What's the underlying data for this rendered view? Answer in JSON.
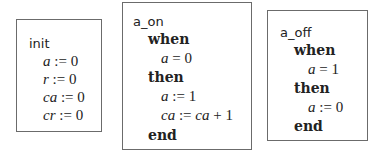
{
  "events": [
    {
      "name": "init",
      "actions": [
        {
          "var": "a",
          "op": ":=",
          "expr": "0"
        },
        {
          "var": "r",
          "op": ":=",
          "expr": "0"
        },
        {
          "var": "ca",
          "op": ":=",
          "expr": "0"
        },
        {
          "var": "cr",
          "op": ":=",
          "expr": "0"
        }
      ]
    },
    {
      "name": "a_on",
      "when_kw": "when",
      "guard": {
        "var": "a",
        "op": "=",
        "expr": "0"
      },
      "then_kw": "then",
      "actions": [
        {
          "var": "a",
          "op": ":=",
          "expr": "1"
        },
        {
          "var": "ca",
          "op": ":=",
          "expr_var": "ca",
          "expr_rest": "+ 1"
        }
      ],
      "end_kw": "end"
    },
    {
      "name": "a_off",
      "when_kw": "when",
      "guard": {
        "var": "a",
        "op": "=",
        "expr": "1"
      },
      "then_kw": "then",
      "actions": [
        {
          "var": "a",
          "op": ":=",
          "expr": "0"
        }
      ],
      "end_kw": "end"
    }
  ]
}
